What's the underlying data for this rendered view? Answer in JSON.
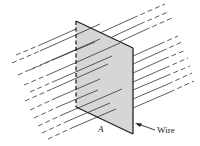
{
  "figure": {
    "labels": {
      "area": "A",
      "wire": "Wire"
    },
    "colors": {
      "plane_fill": "#d6d6d6",
      "edge": "#222222",
      "field_line": "#333333",
      "background": "#ffffff"
    },
    "plane": {
      "corners": [
        [
          76,
          21
        ],
        [
          133,
          48
        ],
        [
          133,
          134
        ],
        [
          76,
          107
        ]
      ],
      "dashed_edge": "left"
    },
    "field_lines": {
      "count": 14,
      "slope": -0.45,
      "style": "dashed outside loop, solid near and through loop"
    }
  }
}
